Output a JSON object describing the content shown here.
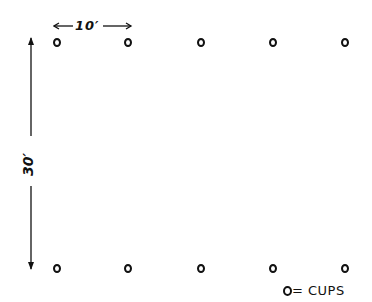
{
  "diagram": {
    "horizontal_dimension": "10′",
    "vertical_dimension": "30′",
    "legend": {
      "symbol": "O",
      "text": "= CUPS"
    },
    "cups": {
      "columns_x": [
        57,
        128,
        201,
        273,
        345
      ],
      "rows_y": [
        43,
        269
      ],
      "count": 10
    }
  }
}
